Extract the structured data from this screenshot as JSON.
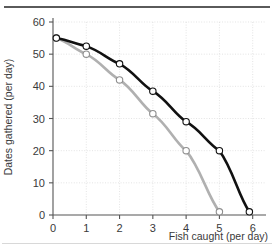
{
  "chart_data": {
    "type": "line",
    "title": "",
    "subtitle": "",
    "xlabel": "Fish caught (per day)",
    "ylabel": "Dates gathered (per day)",
    "xlim": [
      0,
      6.4
    ],
    "ylim": [
      0,
      60
    ],
    "xticks": [
      0,
      1,
      2,
      3,
      4,
      5,
      6
    ],
    "xtick_labels": [
      "0",
      "1",
      "2",
      "3",
      "4",
      "5",
      "6"
    ],
    "yticks": [
      0,
      10,
      20,
      30,
      40,
      50,
      60
    ],
    "ytick_labels": [
      "0",
      "10",
      "20",
      "30",
      "40",
      "50",
      "60"
    ],
    "grid": true,
    "legend": "none",
    "annotations": [],
    "series": [
      {
        "name": "outer-frontier",
        "color": "#111111",
        "marker": "open-circle",
        "points": [
          {
            "x": 0.1,
            "y": 55
          },
          {
            "x": 1,
            "y": 52.5
          },
          {
            "x": 2,
            "y": 47
          },
          {
            "x": 3,
            "y": 38.5
          },
          {
            "x": 4,
            "y": 29
          },
          {
            "x": 5,
            "y": 20
          },
          {
            "x": 5.9,
            "y": 1
          }
        ]
      },
      {
        "name": "inner-frontier",
        "color": "#b0b0b0",
        "marker": "open-circle",
        "points": [
          {
            "x": 0.1,
            "y": 55
          },
          {
            "x": 1,
            "y": 50
          },
          {
            "x": 2,
            "y": 42
          },
          {
            "x": 3,
            "y": 31.5
          },
          {
            "x": 4,
            "y": 20
          },
          {
            "x": 5,
            "y": 1
          }
        ]
      }
    ]
  }
}
